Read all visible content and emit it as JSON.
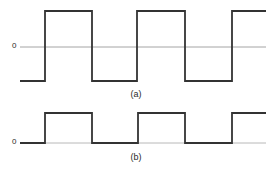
{
  "figure": {
    "width": 270,
    "height": 177,
    "background_color": "#ffffff",
    "trace_color": "#333333",
    "axis_color": "#8c8c8c",
    "text_color": "#2b2b2b"
  },
  "panels": [
    {
      "id": "a",
      "caption": "(a)",
      "zero_label": "0",
      "description": "Bipolar square wave alternating between positive and negative levels about the zero axis",
      "waveform_type": "bipolar-square",
      "levels": {
        "high_y": 11,
        "low_y": 81,
        "zero_y": 47
      },
      "x_start": 20,
      "x_end": 266,
      "transitions": [
        {
          "x": 45,
          "edge": "rising"
        },
        {
          "x": 92,
          "edge": "falling"
        },
        {
          "x": 137,
          "edge": "rising"
        },
        {
          "x": 185,
          "edge": "falling"
        },
        {
          "x": 232,
          "edge": "rising"
        }
      ],
      "initial_state": "low",
      "final_state": "high"
    },
    {
      "id": "b",
      "caption": "(b)",
      "zero_label": "0",
      "description": "Unipolar square wave switching between zero and a positive level",
      "waveform_type": "unipolar-square",
      "levels": {
        "high_y": 113,
        "low_y": 143,
        "zero_y": 143
      },
      "x_start": 20,
      "x_end": 266,
      "transitions": [
        {
          "x": 45,
          "edge": "rising"
        },
        {
          "x": 92,
          "edge": "falling"
        },
        {
          "x": 138,
          "edge": "rising"
        },
        {
          "x": 185,
          "edge": "falling"
        },
        {
          "x": 232,
          "edge": "rising"
        }
      ],
      "initial_state": "low",
      "final_state": "high"
    }
  ],
  "chart_data": {
    "type": "line",
    "xlabel": "",
    "ylabel": "",
    "grid": false,
    "legend": "none",
    "series": [
      {
        "name": "(a)",
        "comment": "Bipolar square wave: +1 high, -1 low, zero reference line drawn",
        "x": [
          20,
          45,
          45,
          92,
          92,
          137,
          137,
          185,
          185,
          232,
          232,
          266
        ],
        "values": [
          -1,
          -1,
          1,
          1,
          -1,
          -1,
          1,
          1,
          -1,
          -1,
          1,
          1
        ],
        "ylim": [
          -1.4,
          1.4
        ]
      },
      {
        "name": "(b)",
        "comment": "Unipolar square wave: +1 high, 0 low, baseline at zero",
        "x": [
          20,
          45,
          45,
          92,
          92,
          138,
          138,
          185,
          185,
          232,
          232,
          266
        ],
        "values": [
          0,
          0,
          1,
          1,
          0,
          0,
          1,
          1,
          0,
          0,
          1,
          1
        ],
        "ylim": [
          -0.2,
          1.3
        ]
      }
    ],
    "annotations": [
      {
        "text": "0",
        "panel": "a",
        "role": "zero-axis-label"
      },
      {
        "text": "(a)",
        "panel": "a",
        "role": "panel-caption"
      },
      {
        "text": "0",
        "panel": "b",
        "role": "zero-axis-label"
      },
      {
        "text": "(b)",
        "panel": "b",
        "role": "panel-caption"
      }
    ]
  }
}
